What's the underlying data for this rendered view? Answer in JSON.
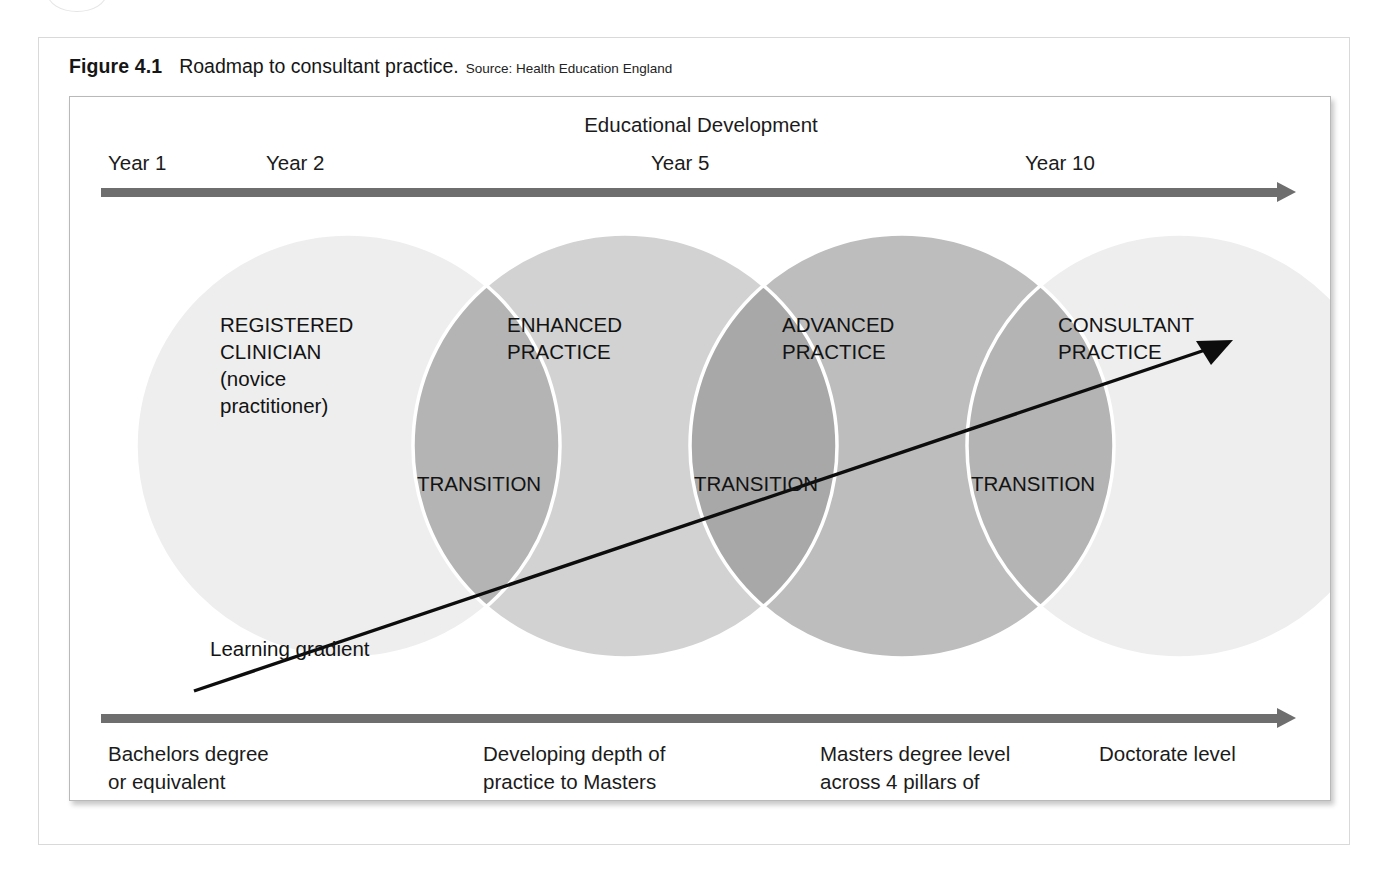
{
  "figure": {
    "number": "Figure 4.1",
    "title": "Roadmap to consultant practice.",
    "source": "Source: Health Education England"
  },
  "diagram": {
    "top_axis": {
      "title": "Educational Development",
      "ticks": [
        {
          "label": "Year 1"
        },
        {
          "label": "Year 2"
        },
        {
          "label": "Year 5"
        },
        {
          "label": "Year 10"
        }
      ]
    },
    "stages": [
      {
        "label": "REGISTERED\nCLINICIAN\n(novice\npractitioner)"
      },
      {
        "label": "ENHANCED\nPRACTICE"
      },
      {
        "label": "ADVANCED\nPRACTICE"
      },
      {
        "label": "CONSULTANT\nPRACTICE"
      }
    ],
    "transitions": [
      "TRANSITION",
      "TRANSITION",
      "TRANSITION"
    ],
    "learning_gradient_label": "Learning gradient",
    "bottom_axis": {
      "notes": [
        "Bachelors degree\nor equivalent",
        "Developing depth of\npractice to Masters\nDegree level",
        "Masters degree level\nacross 4 pillars of\npractice",
        "Doctorate level"
      ]
    }
  },
  "chart_data": {
    "type": "diagram",
    "title": "Roadmap to consultant practice",
    "subtitle": "Source: Health Education England",
    "xlabel": "Educational Development",
    "x_ticks": [
      "Year 1",
      "Year 2",
      "Year 5",
      "Year 10"
    ],
    "series": [
      {
        "name": "Practice stages",
        "values": [
          "REGISTERED CLINICIAN (novice practitioner)",
          "ENHANCED PRACTICE",
          "ADVANCED PRACTICE",
          "CONSULTANT PRACTICE"
        ]
      },
      {
        "name": "Transitions (circle overlaps)",
        "values": [
          "TRANSITION",
          "TRANSITION",
          "TRANSITION"
        ]
      },
      {
        "name": "Academic level",
        "values": [
          "Bachelors degree or equivalent",
          "Developing depth of practice to Masters Degree level",
          "Masters degree level across 4 pillars of practice",
          "Doctorate level"
        ]
      }
    ],
    "annotations": [
      "Learning gradient"
    ],
    "legend": "none",
    "grid": false,
    "colors": {
      "circle_1": "#eeeeee",
      "circle_2": "#d2d2d2",
      "circle_3": "#bdbdbd",
      "circle_4": "#eeeeee",
      "overlap_1": "#b4b4b4",
      "overlap_2": "#a8a8a8",
      "overlap_3": "#b4b4b4",
      "axis_arrow": "#6e6e6e",
      "gradient_arrow": "#0d0d0d",
      "text": "#131313"
    }
  }
}
